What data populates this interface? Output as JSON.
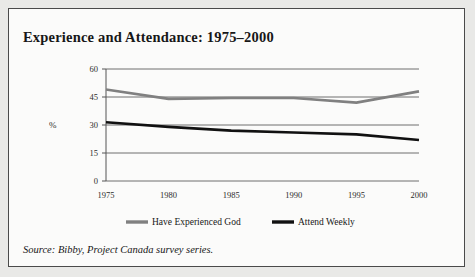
{
  "figure": {
    "title": "Experience and Attendance: 1975–2000",
    "source": "Source: Bibby, Project Canada survey series.",
    "border_color": "#4a4a4a",
    "background": "#fbfbfa",
    "page_background": "#e9e9e7"
  },
  "chart_data": {
    "type": "line",
    "title": "Experience and Attendance: 1975–2000",
    "xlabel": "",
    "ylabel": "%",
    "categories": [
      "1975",
      "1980",
      "1985",
      "1990",
      "1995",
      "2000"
    ],
    "x": [
      1975,
      1980,
      1985,
      1990,
      1995,
      2000
    ],
    "series": [
      {
        "name": "Have Experienced God",
        "color": "#808080",
        "values": [
          49,
          44,
          44.5,
          44.5,
          42,
          48
        ]
      },
      {
        "name": "Attend Weekly",
        "color": "#111111",
        "values": [
          31.5,
          29,
          27,
          26,
          25,
          22
        ]
      }
    ],
    "ylim": [
      0,
      60
    ],
    "yticks": [
      0,
      15,
      30,
      45,
      60
    ],
    "ytick_labels": [
      "0",
      "15",
      "30",
      "45",
      "60"
    ],
    "xtick_labels": [
      "1975",
      "1980",
      "1985",
      "1990",
      "1995",
      "2000"
    ],
    "grid": "horizontal",
    "legend_position": "bottom",
    "legend": [
      "Have Experienced God",
      "Attend Weekly"
    ]
  }
}
